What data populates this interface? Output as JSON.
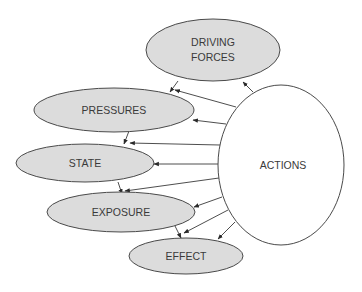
{
  "diagram": {
    "title": "",
    "colors": {
      "node_fill": "#dcdcdc",
      "actions_fill": "#ffffff",
      "stroke": "#4a4a4a",
      "text": "#3a3a3a"
    },
    "nodes": [
      {
        "id": "driving_forces",
        "label_line1": "DRIVING",
        "label_line2": "FORCES"
      },
      {
        "id": "pressures",
        "label": "PRESSURES"
      },
      {
        "id": "state",
        "label": "STATE"
      },
      {
        "id": "exposure",
        "label": "EXPOSURE"
      },
      {
        "id": "effect",
        "label": "EFFECT"
      },
      {
        "id": "actions",
        "label": "ACTIONS"
      }
    ],
    "edges": [
      {
        "from": "driving_forces",
        "to": "pressures"
      },
      {
        "from": "pressures",
        "to": "state"
      },
      {
        "from": "state",
        "to": "exposure"
      },
      {
        "from": "exposure",
        "to": "effect"
      },
      {
        "from": "actions",
        "to": "driving_forces"
      },
      {
        "from": "actions",
        "to": "pressures"
      },
      {
        "from": "actions",
        "to": "pressures"
      },
      {
        "from": "actions",
        "to": "state"
      },
      {
        "from": "actions",
        "to": "state"
      },
      {
        "from": "actions",
        "to": "exposure"
      },
      {
        "from": "actions",
        "to": "exposure"
      },
      {
        "from": "actions",
        "to": "effect"
      },
      {
        "from": "actions",
        "to": "effect"
      }
    ]
  }
}
